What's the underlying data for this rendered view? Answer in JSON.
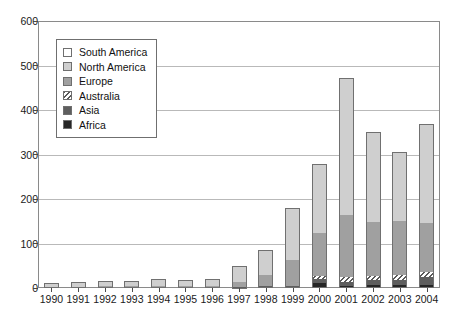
{
  "chart_data": {
    "type": "bar",
    "subtype": "stacked-vertical",
    "title": "",
    "xlabel": "",
    "ylabel": "",
    "ylim": [
      0,
      600
    ],
    "ytick_step": 100,
    "yticks": [
      0,
      100,
      200,
      300,
      400,
      500,
      600
    ],
    "ytick_labels": [
      "0",
      "100",
      "200",
      "300",
      "400",
      "500",
      "600"
    ],
    "grid": true,
    "grid_axis": "y",
    "legend_position": "upper-left-inside",
    "categories": [
      "1990",
      "1991",
      "1992",
      "1993",
      "1994",
      "1995",
      "1996",
      "1997",
      "1998",
      "1999",
      "2000",
      "2001",
      "2002",
      "2003",
      "2004"
    ],
    "stack_order_bottom_to_top": [
      "Africa",
      "Asia",
      "Australia",
      "Europe",
      "North America",
      "South America"
    ],
    "series": [
      {
        "name": "South America",
        "color": "#ffffff",
        "pattern": "solid",
        "values": [
          0,
          0,
          0,
          0,
          0,
          0,
          0,
          0,
          0,
          0,
          0,
          0,
          0,
          0,
          0
        ]
      },
      {
        "name": "North America",
        "color": "#cfcfcf",
        "pattern": "solid",
        "values": [
          10,
          11,
          10,
          12,
          16,
          14,
          15,
          36,
          56,
          118,
          155,
          310,
          202,
          155,
          222
        ]
      },
      {
        "name": "Europe",
        "color": "#a0a0a0",
        "pattern": "solid",
        "values": [
          2,
          3,
          5,
          4,
          5,
          5,
          5,
          11,
          26,
          57,
          95,
          138,
          120,
          120,
          110
        ]
      },
      {
        "name": "Australia",
        "color": "#ffffff",
        "pattern": "diagonal-hatch",
        "values": [
          0,
          0,
          0,
          0,
          0,
          0,
          0,
          0,
          0,
          0,
          8,
          12,
          10,
          11,
          11
        ]
      },
      {
        "name": "Asia",
        "color": "#5e5e5e",
        "pattern": "solid",
        "values": [
          0,
          0,
          0,
          0,
          0,
          0,
          0,
          1,
          2,
          3,
          8,
          9,
          12,
          13,
          18
        ]
      },
      {
        "name": "Africa",
        "color": "#262626",
        "pattern": "solid",
        "values": [
          0,
          0,
          0,
          0,
          0,
          0,
          0,
          1,
          2,
          2,
          12,
          4,
          6,
          6,
          7
        ]
      }
    ],
    "totals": [
      12,
      14,
      15,
      16,
      21,
      19,
      20,
      49,
      86,
      180,
      278,
      473,
      350,
      305,
      368
    ]
  },
  "legend": {
    "items": [
      {
        "label": "South America",
        "swatch": "south-america-swatch"
      },
      {
        "label": "North America",
        "swatch": "north-america-swatch"
      },
      {
        "label": "Europe",
        "swatch": "europe-swatch"
      },
      {
        "label": "Australia",
        "swatch": "australia-swatch"
      },
      {
        "label": "Asia",
        "swatch": "asia-swatch"
      },
      {
        "label": "Africa",
        "swatch": "africa-swatch"
      }
    ]
  },
  "colors": {
    "south_america": "#ffffff",
    "north_america": "#cfcfcf",
    "europe": "#a0a0a0",
    "australia": "#ffffff",
    "asia": "#5e5e5e",
    "africa": "#262626",
    "gridline": "#b9b9b9",
    "frame": "#8a8a8a",
    "text": "#1a1a1a"
  }
}
